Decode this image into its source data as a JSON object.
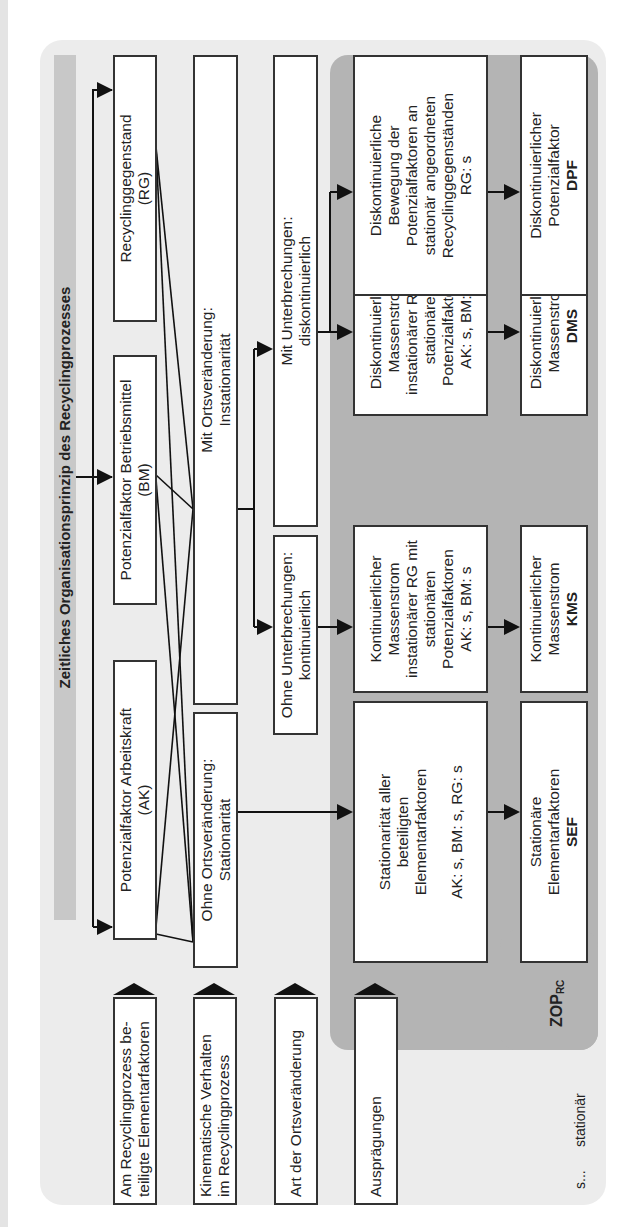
{
  "title": "Zeitliches Organisationsprinzip des Recyclingprozesses",
  "row_labels": [
    {
      "line1": "Am Recyclingprozess be-",
      "line2": "teiligte Elementarfaktoren"
    },
    {
      "line1": "Kinematische Verhalten",
      "line2": "im Recyclingprozess"
    },
    {
      "line1": "Art der Ortsveränderung",
      "line2": ""
    },
    {
      "line1": "Ausprägungen",
      "line2": ""
    }
  ],
  "elementarfaktoren": [
    {
      "line1": "Potenzialfaktor Arbeitskraft",
      "line2": "(AK)"
    },
    {
      "line1": "Potenzialfaktor Betriebsmittel",
      "line2": "(BM)"
    },
    {
      "line1": "Recyclinggegenstand",
      "line2": "(RG)"
    }
  ],
  "kinematik": [
    {
      "line1": "Ohne Ortsveränderung:",
      "line2": "Stationarität"
    },
    {
      "line1": "Mit Ortsveränderung:",
      "line2": "Instationarität"
    }
  ],
  "ortsveraenderung": [
    {
      "line1": "Ohne Unterbrechungen:",
      "line2": "kontinuierlich"
    },
    {
      "line1": "Mit Unterbrechungen:",
      "line2": "diskontinuierlich"
    }
  ],
  "auspraegungen": [
    {
      "lines": [
        "Stationarität aller",
        "beteiligten",
        "Elementarfaktoren",
        "",
        "AK: s, BM: s, RG: s"
      ]
    },
    {
      "lines": [
        "Kontinuierlicher",
        "Massenstrom",
        "instationärer RG mit",
        "stationären",
        "Potenzialfaktoren",
        "AK: s, BM: s"
      ]
    },
    {
      "lines": [
        "Diskontinuierlicher",
        "Massenstrom",
        "instationärer RG mit",
        "stationären",
        "Potenzialfaktoren",
        "AK: s, BM: s"
      ]
    },
    {
      "lines": [
        "Diskontinuierliche",
        "Bewegung der",
        "Potenzialfaktoren an",
        "stationär angeordneten",
        "Recyclinggegenständen",
        "RG: s"
      ]
    }
  ],
  "zop_types": [
    {
      "line1": "Stationäre",
      "line2": "Elementarfaktoren",
      "abbr": "SEF"
    },
    {
      "line1": "Kontinuierlicher",
      "line2": "Massenstrom",
      "abbr": "KMS"
    },
    {
      "line1": "Diskontinuierlicher",
      "line2": "Massenstrom",
      "abbr": "DMS"
    },
    {
      "line1": "Diskontinuierlicher",
      "line2": "Potenzialfaktor",
      "abbr": "DPF"
    }
  ],
  "zop_label": {
    "main": "ZOP",
    "sub": "RC"
  },
  "legend": {
    "key": "s...",
    "value": "stationär"
  },
  "colors": {
    "panel": "#ececec",
    "title_band": "#c8c8c8",
    "zop_panel": "#b4b4b4",
    "border": "#333333"
  }
}
